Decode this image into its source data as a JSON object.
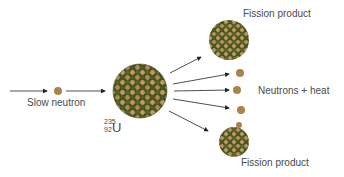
{
  "diagram": {
    "labels": {
      "slow_neutron": "Slow neutron",
      "fission_product_top": "Fission product",
      "fission_product_bottom": "Fission product",
      "neutrons_heat": "Neutrons + heat"
    },
    "isotope": {
      "symbol": "U",
      "mass_number": "235",
      "atomic_number": "92"
    },
    "colors": {
      "neutron": "#a8844a",
      "proton_dark": "#4d5a22",
      "proton_light": "#c09a5e",
      "arrow": "#222222",
      "text": "#4a4a4a"
    }
  }
}
